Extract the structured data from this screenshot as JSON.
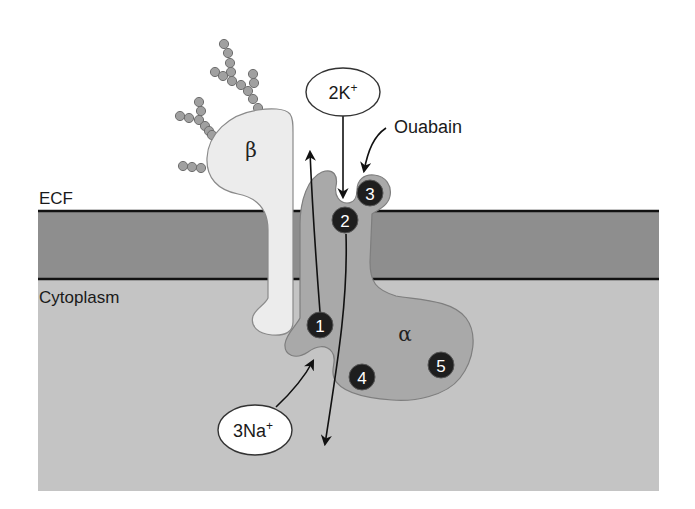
{
  "diagram": {
    "regions": {
      "ecf_label": "ECF",
      "cytoplasm_label": "Cytoplasm"
    },
    "subunits": {
      "beta_label": "β",
      "alpha_label": "α"
    },
    "ions": {
      "potassium": {
        "count": "2",
        "symbol": "K",
        "charge": "+"
      },
      "sodium": {
        "count": "3",
        "symbol": "Na",
        "charge": "+"
      }
    },
    "inhibitor_label": "Ouabain",
    "binding_sites": [
      {
        "number": "1"
      },
      {
        "number": "2"
      },
      {
        "number": "3"
      },
      {
        "number": "4"
      },
      {
        "number": "5"
      }
    ],
    "colors": {
      "ecf": "#ffffff",
      "membrane": "#8e8e8e",
      "cytoplasm": "#c4c4c4",
      "alpha_subunit": "#a9a9a9",
      "beta_subunit": "#ececec",
      "glycan": "#a0a0a0",
      "site_marker": "#1e1e1e"
    }
  }
}
